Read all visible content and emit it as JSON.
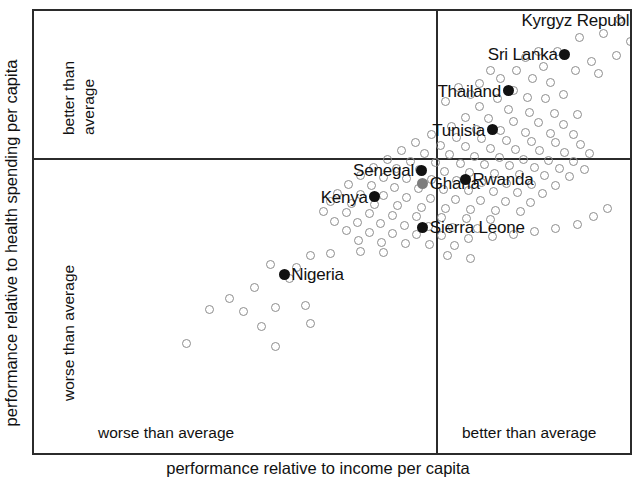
{
  "axes": {
    "x_title": "performance relative to income per capita",
    "y_title": "performance relative to health spending per capita",
    "x_left_label": "worse than average",
    "x_right_label": "better than average",
    "y_top_label_line1": "better than",
    "y_top_label_line2": "average",
    "y_bottom_label": "worse than average"
  },
  "chart_data": {
    "type": "scatter",
    "title": "",
    "xlabel": "performance relative to income per capita",
    "ylabel": "performance relative to health spending per capita",
    "xlim": [
      -1,
      1
    ],
    "ylim": [
      -1,
      1
    ],
    "grid": false,
    "legend": null,
    "axis_note": "Axes are unlabeled/unitless; solid lines at x=0 and y=0 split the panel into four quadrants. Left of vertical line = 'worse than average' income performance, right = 'better than average'. Above horizontal line = 'better than average' health-spending performance, below = 'worse than average'.",
    "quadrant_labels": {
      "x_left": "worse than average",
      "x_right": "better than average",
      "y_top": "better than average",
      "y_bottom": "worse than average"
    },
    "marker_styles": {
      "unlabeled": "open grey circle",
      "highlighted": "filled black circle",
      "ghana": "filled grey circle"
    },
    "highlighted_points": [
      {
        "name": "Kyrgyz Republic",
        "x": 0.595,
        "y": 0.52,
        "label_side": "left",
        "marker": "filled"
      },
      {
        "name": "Sri Lanka",
        "x": 0.36,
        "y": 0.39,
        "label_side": "left",
        "marker": "filled"
      },
      {
        "name": "Thailand",
        "x": 0.2,
        "y": 0.255,
        "label_side": "left",
        "marker": "filled"
      },
      {
        "name": "Tunisia",
        "x": 0.155,
        "y": 0.11,
        "label_side": "left",
        "marker": "filled"
      },
      {
        "name": "Senegal",
        "x": -0.045,
        "y": -0.042,
        "label_side": "left",
        "marker": "filled"
      },
      {
        "name": "Kenya",
        "x": -0.175,
        "y": -0.14,
        "label_side": "left",
        "marker": "filled"
      },
      {
        "name": "Ghana",
        "x": -0.04,
        "y": -0.09,
        "label_side": "right",
        "marker": "grey"
      },
      {
        "name": "Rwanda",
        "x": 0.08,
        "y": -0.075,
        "label_side": "right",
        "marker": "filled"
      },
      {
        "name": "Sierra Leone",
        "x": -0.04,
        "y": -0.255,
        "label_side": "right",
        "marker": "filled"
      },
      {
        "name": "Nigeria",
        "x": -0.43,
        "y": -0.43,
        "label_side": "right",
        "marker": "filled"
      }
    ],
    "unlabeled_points": [
      [
        0.655,
        0.615
      ],
      [
        0.57,
        0.565
      ],
      [
        0.515,
        0.52
      ],
      [
        0.47,
        0.47
      ],
      [
        0.545,
        0.44
      ],
      [
        0.4,
        0.455
      ],
      [
        0.62,
        0.405
      ],
      [
        0.505,
        0.385
      ],
      [
        0.435,
        0.365
      ],
      [
        0.34,
        0.4
      ],
      [
        0.285,
        0.4
      ],
      [
        0.25,
        0.38
      ],
      [
        0.3,
        0.345
      ],
      [
        0.39,
        0.33
      ],
      [
        0.455,
        0.32
      ],
      [
        0.225,
        0.33
      ],
      [
        0.27,
        0.3
      ],
      [
        0.32,
        0.285
      ],
      [
        0.18,
        0.3
      ],
      [
        0.15,
        0.33
      ],
      [
        0.12,
        0.28
      ],
      [
        0.215,
        0.255
      ],
      [
        0.255,
        0.23
      ],
      [
        0.305,
        0.225
      ],
      [
        0.355,
        0.24
      ],
      [
        0.17,
        0.225
      ],
      [
        0.095,
        0.24
      ],
      [
        0.06,
        0.265
      ],
      [
        0.025,
        0.215
      ],
      [
        0.12,
        0.195
      ],
      [
        0.2,
        0.185
      ],
      [
        0.26,
        0.175
      ],
      [
        0.33,
        0.17
      ],
      [
        0.395,
        0.165
      ],
      [
        0.08,
        0.155
      ],
      [
        0.145,
        0.15
      ],
      [
        0.215,
        0.14
      ],
      [
        0.285,
        0.135
      ],
      [
        0.355,
        0.13
      ],
      [
        0.04,
        0.12
      ],
      [
        0.11,
        0.11
      ],
      [
        0.18,
        0.105
      ],
      [
        0.25,
        0.1
      ],
      [
        0.32,
        0.095
      ],
      [
        0.385,
        0.09
      ],
      [
        -0.015,
        0.09
      ],
      [
        0.055,
        0.08
      ],
      [
        0.125,
        0.075
      ],
      [
        0.195,
        0.07
      ],
      [
        0.265,
        0.065
      ],
      [
        0.335,
        0.06
      ],
      [
        0.405,
        0.055
      ],
      [
        -0.06,
        0.06
      ],
      [
        0.01,
        0.05
      ],
      [
        0.08,
        0.045
      ],
      [
        0.15,
        0.04
      ],
      [
        0.22,
        0.035
      ],
      [
        0.29,
        0.03
      ],
      [
        0.36,
        0.025
      ],
      [
        0.43,
        0.02
      ],
      [
        -0.1,
        0.03
      ],
      [
        -0.035,
        0.02
      ],
      [
        0.035,
        0.015
      ],
      [
        0.105,
        0.01
      ],
      [
        0.175,
        0.005
      ],
      [
        0.245,
        0.0
      ],
      [
        0.315,
        -0.005
      ],
      [
        0.385,
        -0.01
      ],
      [
        -0.14,
        0.0
      ],
      [
        -0.075,
        -0.008
      ],
      [
        -0.005,
        -0.012
      ],
      [
        0.065,
        -0.018
      ],
      [
        0.135,
        -0.022
      ],
      [
        0.205,
        -0.026
      ],
      [
        0.275,
        -0.03
      ],
      [
        0.345,
        -0.034
      ],
      [
        0.415,
        -0.038
      ],
      [
        -0.18,
        -0.03
      ],
      [
        -0.115,
        -0.036
      ],
      [
        -0.048,
        -0.04
      ],
      [
        0.022,
        -0.045
      ],
      [
        0.092,
        -0.05
      ],
      [
        0.162,
        -0.055
      ],
      [
        0.232,
        -0.058
      ],
      [
        0.302,
        -0.062
      ],
      [
        0.372,
        -0.066
      ],
      [
        -0.215,
        -0.062
      ],
      [
        -0.15,
        -0.068
      ],
      [
        -0.085,
        -0.072
      ],
      [
        -0.015,
        -0.078
      ],
      [
        0.055,
        -0.082
      ],
      [
        0.125,
        -0.086
      ],
      [
        0.195,
        -0.09
      ],
      [
        0.265,
        -0.094
      ],
      [
        0.335,
        -0.098
      ],
      [
        -0.25,
        -0.095
      ],
      [
        -0.185,
        -0.1
      ],
      [
        -0.12,
        -0.105
      ],
      [
        -0.052,
        -0.11
      ],
      [
        0.018,
        -0.114
      ],
      [
        0.088,
        -0.118
      ],
      [
        0.158,
        -0.122
      ],
      [
        0.228,
        -0.126
      ],
      [
        0.298,
        -0.13
      ],
      [
        -0.28,
        -0.128
      ],
      [
        -0.215,
        -0.133
      ],
      [
        -0.15,
        -0.138
      ],
      [
        -0.085,
        -0.142
      ],
      [
        -0.018,
        -0.146
      ],
      [
        0.052,
        -0.15
      ],
      [
        0.122,
        -0.154
      ],
      [
        0.192,
        -0.158
      ],
      [
        0.262,
        -0.162
      ],
      [
        -0.3,
        -0.16
      ],
      [
        -0.24,
        -0.166
      ],
      [
        -0.175,
        -0.17
      ],
      [
        -0.11,
        -0.175
      ],
      [
        -0.045,
        -0.18
      ],
      [
        0.025,
        -0.184
      ],
      [
        0.095,
        -0.188
      ],
      [
        0.165,
        -0.192
      ],
      [
        0.235,
        -0.196
      ],
      [
        -0.32,
        -0.195
      ],
      [
        -0.255,
        -0.2
      ],
      [
        -0.19,
        -0.205
      ],
      [
        -0.125,
        -0.21
      ],
      [
        -0.058,
        -0.214
      ],
      [
        0.012,
        -0.218
      ],
      [
        0.082,
        -0.222
      ],
      [
        0.152,
        -0.226
      ],
      [
        -0.29,
        -0.232
      ],
      [
        -0.225,
        -0.238
      ],
      [
        -0.16,
        -0.242
      ],
      [
        -0.092,
        -0.248
      ],
      [
        -0.025,
        -0.252
      ],
      [
        0.045,
        -0.256
      ],
      [
        0.115,
        -0.26
      ],
      [
        -0.255,
        -0.268
      ],
      [
        -0.19,
        -0.274
      ],
      [
        -0.125,
        -0.278
      ],
      [
        -0.058,
        -0.282
      ],
      [
        0.012,
        -0.286
      ],
      [
        -0.22,
        -0.305
      ],
      [
        -0.155,
        -0.31
      ],
      [
        -0.09,
        -0.315
      ],
      [
        -0.022,
        -0.318
      ],
      [
        0.048,
        -0.322
      ],
      [
        0.09,
        -0.295
      ],
      [
        0.155,
        -0.29
      ],
      [
        0.215,
        -0.282
      ],
      [
        0.275,
        -0.27
      ],
      [
        0.335,
        -0.258
      ],
      [
        0.395,
        -0.245
      ],
      [
        0.44,
        -0.215
      ],
      [
        0.48,
        -0.185
      ],
      [
        -0.355,
        -0.36
      ],
      [
        -0.3,
        -0.352
      ],
      [
        -0.395,
        -0.405
      ],
      [
        -0.47,
        -0.395
      ],
      [
        -0.415,
        -0.445
      ],
      [
        -0.515,
        -0.478
      ],
      [
        -0.585,
        -0.52
      ],
      [
        -0.64,
        -0.56
      ],
      [
        -0.545,
        -0.57
      ],
      [
        -0.455,
        -0.555
      ],
      [
        -0.495,
        -0.625
      ],
      [
        -0.705,
        -0.69
      ],
      [
        -0.455,
        -0.7
      ],
      [
        -0.37,
        -0.545
      ],
      [
        -0.355,
        -0.615
      ],
      [
        0.03,
        -0.36
      ],
      [
        0.095,
        -0.37
      ],
      [
        -0.15,
        -0.35
      ],
      [
        -0.215,
        -0.345
      ]
    ]
  }
}
